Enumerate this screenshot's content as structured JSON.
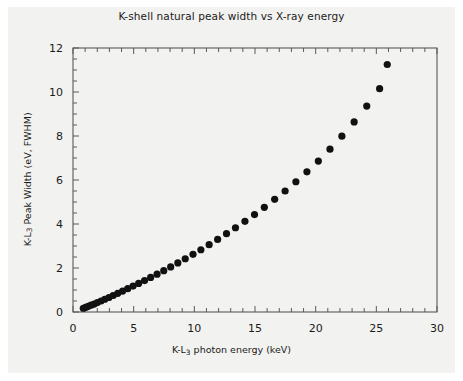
{
  "figure": {
    "title": "K-shell natural peak width vs X-ray energy",
    "background_color": "#f2f2f0",
    "page_background_color": "#ffffff",
    "marker_color": "#111111",
    "axis_color": "#5a5a5a"
  },
  "axes": {
    "x_title_prefix": "K-L",
    "x_title_sub": "3",
    "x_title_suffix": " photon energy (keV)",
    "y_title_prefix": "K-L",
    "y_title_sub": "3",
    "y_title_suffix": " Peak Width (eV, FWHM)",
    "x_ticks": [
      "0",
      "5",
      "10",
      "15",
      "20",
      "25",
      "30"
    ],
    "y_ticks": [
      "0",
      "2",
      "4",
      "6",
      "8",
      "10",
      "12"
    ]
  },
  "chart_data": {
    "type": "scatter",
    "title": "K-shell natural peak width vs X-ray energy",
    "xlabel": "K-L3 photon energy (keV)",
    "ylabel": "K-L3 Peak Width (eV, FWHM)",
    "xlim": [
      0,
      30
    ],
    "ylim": [
      0,
      12
    ],
    "x_ticks": [
      0,
      5,
      10,
      15,
      20,
      25,
      30
    ],
    "y_ticks": [
      0,
      2,
      4,
      6,
      8,
      10,
      12
    ],
    "x_minor_tick_step": 1,
    "y_minor_tick_step": 0.5,
    "grid": false,
    "legend": false,
    "marker": "circle",
    "marker_size": 6,
    "marker_color": "#111111",
    "series": [
      {
        "name": "K-L3 natural width",
        "x": [
          0.85,
          1.04,
          1.25,
          1.49,
          1.74,
          2.01,
          2.31,
          2.62,
          2.96,
          3.31,
          3.69,
          4.09,
          4.51,
          4.95,
          5.41,
          5.9,
          6.4,
          6.93,
          7.48,
          8.05,
          8.64,
          9.25,
          9.89,
          10.54,
          11.22,
          11.92,
          12.65,
          13.39,
          14.17,
          14.96,
          15.77,
          16.62,
          17.48,
          18.37,
          19.28,
          20.22,
          21.18,
          22.16,
          23.17,
          24.21,
          25.27
        ],
        "y": [
          0.17,
          0.21,
          0.26,
          0.31,
          0.36,
          0.43,
          0.5,
          0.58,
          0.66,
          0.75,
          0.85,
          0.95,
          1.06,
          1.18,
          1.3,
          1.43,
          1.57,
          1.72,
          1.88,
          2.05,
          2.23,
          2.42,
          2.62,
          2.83,
          3.06,
          3.3,
          3.56,
          3.83,
          4.12,
          4.43,
          4.76,
          5.12,
          5.5,
          5.92,
          6.37,
          6.86,
          7.4,
          7.99,
          8.64,
          9.36,
          10.15
        ],
        "extra_x": [
          25.9
        ],
        "extra_y": [
          11.25
        ]
      }
    ]
  }
}
